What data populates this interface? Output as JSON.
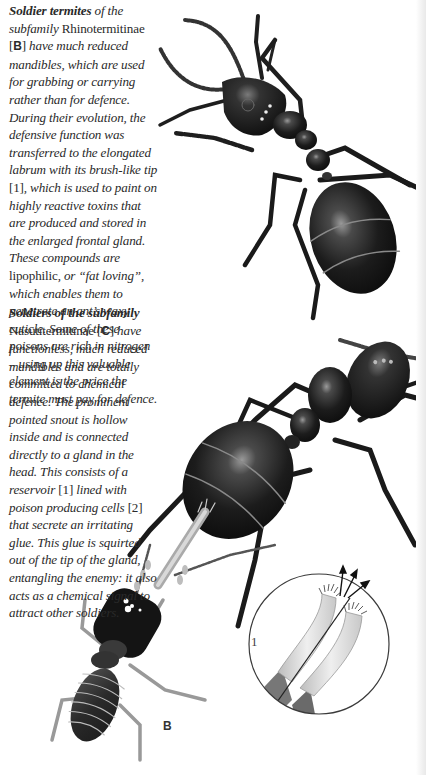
{
  "captions": {
    "rhinotermitinae": {
      "lead_bold": "Soldier termites",
      "part1": " of the",
      "part2": "subfamily ",
      "taxon": "Rhinotermitinae",
      "ref_open": "[",
      "ref_letter": "B",
      "ref_close": "]",
      "part3": " have much reduced mandibles, which are used for grabbing or carrying rather than for defence. During their evolution, the defensive function was transferred to the elongated labrum with its brush-like tip ",
      "num1": "[1]",
      "part4": ", which is used to paint on highly reactive toxins that are produced and stored in the enlarged frontal gland. These compounds are ",
      "lipophilic": "lipophilic,",
      "part5": " or “fat loving”, which enables them to penetrate an ant’s waxy cuticle. Some of these poisons are rich in nitrogen – using up this valuable element is the price the termite must pay for defence."
    },
    "nasutitermitinae": {
      "lead_bold": "Soldiers of the subfamily",
      "taxon": "Nasutitermitinae",
      "ref_open": " [",
      "ref_letter": "C",
      "ref_close": "]",
      "part1": " have functionless, much reduced mandibles and are totally committed to chemical defence. The prominent pointed snout is hollow inside and is connected directly to a gland in the head. This consists of a reservoir ",
      "num1": "[1]",
      "part2": " lined with poison producing cells ",
      "num2": "[2]",
      "part3": " that secrete an irritating glue. This glue is squirted out of the tip of the gland, entangling the enemy: it also acts as a chemical signal to attract other soldiers."
    }
  },
  "figure_labels": {
    "termite_label": "B",
    "inset_label": "1"
  },
  "colors": {
    "text": "#2a2a2a",
    "ant_body": "#1a1a1a",
    "termite_body": "#2b2b2b",
    "inset_labrum": "#d8d8d8"
  }
}
